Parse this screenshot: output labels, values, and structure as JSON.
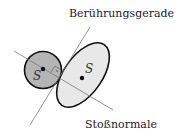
{
  "labels": {
    "tangent": "Berührungsgerade",
    "normal": "Stoßnormale",
    "center_small": "S",
    "center_large": "S"
  },
  "colors": {
    "small_body_fill": "#b5b5b5",
    "large_body_fill": "#e8e8e8",
    "outline": "#111111",
    "line": "#777777"
  }
}
